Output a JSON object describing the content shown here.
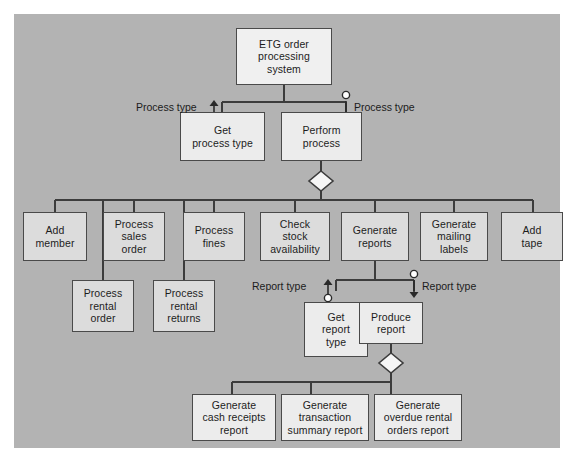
{
  "diagram": {
    "background_color": "#b3b3b3",
    "box_fill": "#dcdcdc",
    "box_border": "#4a4a4a",
    "line_color": "#3c3c3c",
    "text_color": "#1c1c1c"
  },
  "nodes": {
    "root": "ETG order\nprocessing\nsystem",
    "get_process_type": "Get\nprocess type",
    "perform_process": "Perform\nprocess",
    "add_member": "Add\nmember",
    "process_sales_order": "Process\nsales\norder",
    "process_fines": "Process\nfines",
    "check_stock_availability": "Check\nstock\navailability",
    "generate_reports": "Generate\nreports",
    "generate_mailing_labels": "Generate\nmailing\nlabels",
    "add_tape": "Add\ntape",
    "process_rental_order": "Process\nrental\norder",
    "process_rental_returns": "Process\nrental\nreturns",
    "get_report_type": "Get\nreport\ntype",
    "produce_report": "Produce\nreport",
    "generate_cash_receipts_report": "Generate\ncash receipts\nreport",
    "generate_transaction_summary_report": "Generate\ntransaction\nsummary report",
    "generate_overdue_rental_orders_report": "Generate\noverdue rental\norders report"
  },
  "couples": {
    "process_type_up": "Process type",
    "process_type_down": "Process type",
    "report_type_up": "Report type",
    "report_type_down": "Report type"
  }
}
